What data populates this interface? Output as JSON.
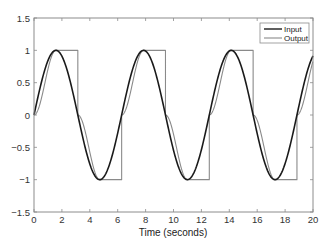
{
  "chart_data": {
    "type": "line",
    "title": "",
    "xlabel": "Time (seconds)",
    "ylabel": "",
    "xlim": [
      0,
      20
    ],
    "ylim": [
      -1.5,
      1.5
    ],
    "grid": false,
    "legend_position": "upper right",
    "x_ticks": [
      0,
      2,
      4,
      6,
      8,
      10,
      12,
      14,
      16,
      18,
      20
    ],
    "x_tick_labels": [
      "0",
      "2",
      "4",
      "6",
      "8",
      "10",
      "12",
      "14",
      "16",
      "18",
      "20"
    ],
    "y_ticks": [
      -1.5,
      -1,
      -0.5,
      0,
      0.5,
      1,
      1.5
    ],
    "y_tick_labels": [
      "−1.5",
      "−1",
      "−0.5",
      "0",
      "0.5",
      "1",
      "1.5"
    ],
    "series": [
      {
        "name": "Input",
        "color": "#1a1a1a",
        "line_width": 1.6,
        "description": "sine wave sin(t), amplitude 1, period 2π",
        "x": [
          0,
          1.5708,
          3.1416,
          4.7124,
          6.2832,
          7.854,
          9.4248,
          10.9956,
          12.5664,
          14.1372,
          15.708,
          17.2788,
          18.8496,
          20
        ],
        "values": [
          0,
          1,
          0,
          -1,
          0,
          1,
          0,
          -1,
          0,
          1,
          0,
          -1,
          0,
          0.913
        ]
      },
      {
        "name": "Output",
        "color": "#8a8a8a",
        "line_width": 1.1,
        "description": "rises as sin² to +1 at π/2, holds +1 until π, drops to 0, falls to −1 at 3π/2, holds −1 until 2π, jumps to 0; repeats",
        "x": [
          0,
          1.5708,
          3.1416,
          3.1416,
          4.7124,
          6.2832,
          6.2832,
          7.854,
          9.4248,
          9.4248,
          10.9956,
          12.5664,
          12.5664,
          14.1372,
          15.708,
          15.708,
          17.2788,
          18.8496,
          18.8496,
          20
        ],
        "values": [
          0,
          1,
          1,
          0,
          -1,
          -1,
          0,
          1,
          1,
          0,
          -1,
          -1,
          0,
          1,
          1,
          0,
          -1,
          -1,
          0,
          0.83
        ]
      }
    ]
  }
}
